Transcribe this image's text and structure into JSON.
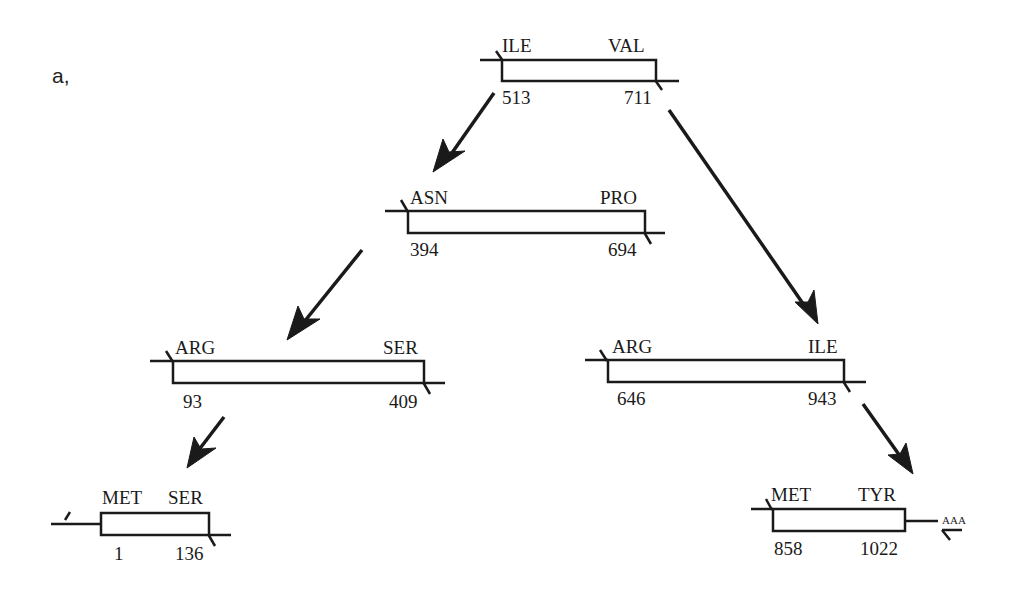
{
  "panel_label": "a,",
  "fragments": [
    {
      "id": "f1",
      "start_aa": "ILE",
      "end_aa": "VAL",
      "start_pos": "513",
      "end_pos": "711"
    },
    {
      "id": "f2",
      "start_aa": "ASN",
      "end_aa": "PRO",
      "start_pos": "394",
      "end_pos": "694"
    },
    {
      "id": "f3",
      "start_aa": "ARG",
      "end_aa": "SER",
      "start_pos": "93",
      "end_pos": "409"
    },
    {
      "id": "f4",
      "start_aa": "ARG",
      "end_aa": "ILE",
      "start_pos": "646",
      "end_pos": "943"
    },
    {
      "id": "f5",
      "start_aa": "MET",
      "end_aa": "SER",
      "start_pos": "1",
      "end_pos": "136"
    },
    {
      "id": "f6",
      "start_aa": "MET",
      "end_aa": "TYR",
      "start_pos": "858",
      "end_pos": "1022",
      "polyA": "AAA"
    }
  ]
}
